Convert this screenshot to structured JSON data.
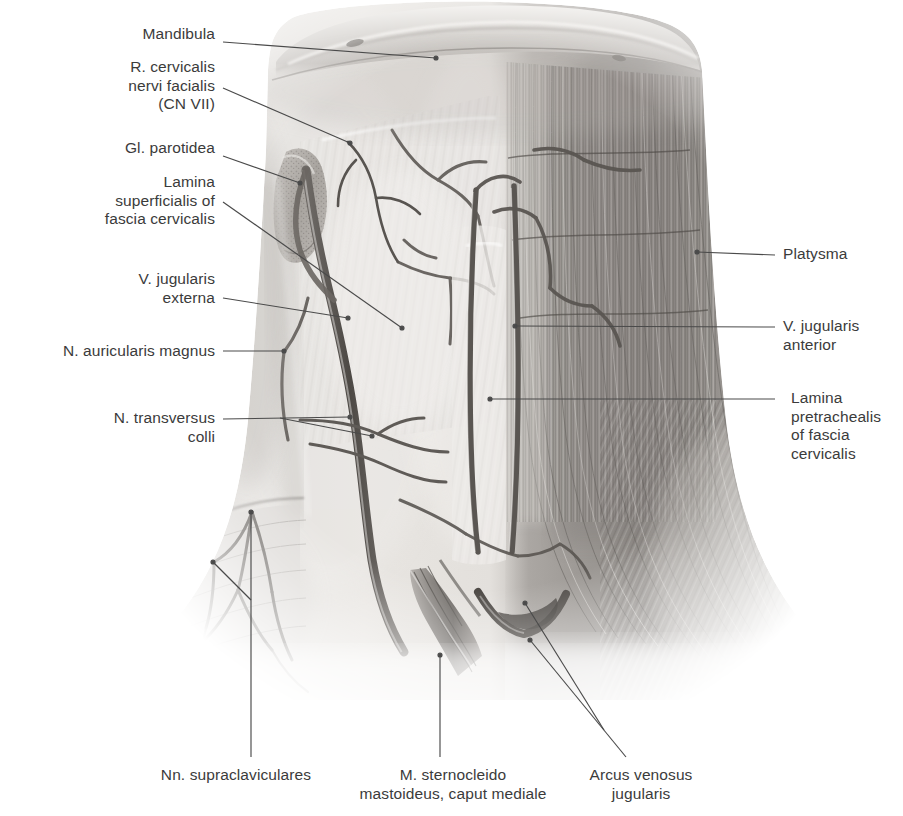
{
  "figure": {
    "type": "anatomical-illustration",
    "style": "grayscale pencil/airbrush medical illustration on white background",
    "view": "anterior view of the neck; platysma reflected on the left side of image, intact on the right side",
    "background_color": "#ffffff",
    "ink_color": "#3b3b3b",
    "leader_line_color": "#4a4a4a"
  },
  "labels": {
    "left": [
      {
        "id": "mandibula",
        "text": "Mandibula",
        "lines": [
          "Mandibula"
        ],
        "align": "right",
        "x": 215,
        "y": 32,
        "leader": {
          "from": [
            223,
            42
          ],
          "to": [
            436,
            58
          ],
          "dot": true
        }
      },
      {
        "id": "r-cervicalis-nervi-facialis",
        "text": "R. cervicalis nervi facialis (CN VII)",
        "lines": [
          "R. cervicalis",
          "nervi facialis",
          "(CN VII)"
        ],
        "align": "right",
        "x": 215,
        "y": 66,
        "leader": {
          "from": [
            223,
            88
          ],
          "to": [
            350,
            143
          ],
          "dot": true
        }
      },
      {
        "id": "gl-parotidea",
        "text": "Gl. parotidea",
        "lines": [
          "Gl. parotidea"
        ],
        "align": "right",
        "x": 215,
        "y": 146,
        "leader": {
          "from": [
            223,
            156
          ],
          "to": [
            300,
            183
          ],
          "dot": true
        }
      },
      {
        "id": "lamina-superficialis-fascia-cervicalis",
        "text": "Lamina superficialis of fascia cervicalis",
        "lines": [
          "Lamina",
          "superficialis of",
          "fascia cervicalis"
        ],
        "align": "right",
        "x": 215,
        "y": 180,
        "leader": {
          "from": [
            223,
            202
          ],
          "to": [
            402,
            328
          ],
          "dot": true
        }
      },
      {
        "id": "v-jugularis-externa",
        "text": "V. jugularis externa",
        "lines": [
          "V. jugularis",
          "externa"
        ],
        "align": "right",
        "x": 215,
        "y": 276,
        "leader": {
          "from": [
            223,
            298
          ],
          "to": [
            348,
            318
          ],
          "dot": true
        }
      },
      {
        "id": "n-auricularis-magnus",
        "text": "N. auricularis magnus",
        "lines": [
          "N. auricularis magnus"
        ],
        "align": "right",
        "x": 215,
        "y": 342,
        "leader": {
          "from": [
            223,
            351
          ],
          "to": [
            284,
            351
          ],
          "dot": true
        }
      },
      {
        "id": "n-transversus-colli",
        "text": "N. transversus colli",
        "lines": [
          "N. transversus",
          "colli"
        ],
        "align": "right",
        "x": 215,
        "y": 410,
        "leader": {
          "from": [
            223,
            419
          ],
          "to": [
            372,
            432
          ],
          "dot": true
        },
        "leader2": {
          "from": [
            223,
            419
          ],
          "to": [
            350,
            417
          ],
          "dot": true
        }
      }
    ],
    "right": [
      {
        "id": "platysma",
        "text": "Platysma",
        "lines": [
          "Platysma"
        ],
        "align": "left",
        "x": 783,
        "y": 245,
        "leader": {
          "from": [
            775,
            255
          ],
          "to": [
            697,
            252
          ],
          "dot": true
        }
      },
      {
        "id": "v-jugularis-anterior",
        "text": "V. jugularis anterior",
        "lines": [
          "V. jugularis",
          "anterior"
        ],
        "align": "left",
        "x": 783,
        "y": 318,
        "leader": {
          "from": [
            775,
            327
          ],
          "to": [
            515,
            326
          ],
          "dot": true
        }
      },
      {
        "id": "lamina-pretrachealis-fascia-cervicalis",
        "text": "Lamina pretrachealis of fascia cervicalis",
        "lines": [
          "Lamina",
          "pretrachealis",
          "of fascia",
          "cervicalis"
        ],
        "align": "left",
        "x": 791,
        "y": 390,
        "leader": {
          "from": [
            775,
            399
          ],
          "to": [
            490,
            399
          ],
          "dot": true
        }
      }
    ],
    "bottom": [
      {
        "id": "nn-supraclaviculares",
        "text": "Nn. supraclaviculares",
        "lines": [
          "Nn. supraclaviculares"
        ],
        "align": "center",
        "x": 236,
        "y": 767,
        "leader": {
          "from": [
            251,
            757
          ],
          "to": [
            251,
            512
          ],
          "dot": true
        },
        "leader2": {
          "from": [
            251,
            600
          ],
          "to": [
            213,
            562
          ],
          "dot": true
        }
      },
      {
        "id": "m-sternocleidomastoideus-caput-mediale",
        "text": "M. sternocleido mastoideus, caput mediale",
        "lines": [
          "M. sternocleido",
          "mastoideus, caput mediale"
        ],
        "align": "center",
        "x": 452,
        "y": 767,
        "leader": {
          "from": [
            440,
            757
          ],
          "to": [
            440,
            655
          ],
          "dot": true
        }
      },
      {
        "id": "arcus-venosus-jugularis",
        "text": "Arcus venosus jugularis",
        "lines": [
          "Arcus venosus",
          "jugularis"
        ],
        "align": "center",
        "x": 639,
        "y": 767,
        "leader": {
          "from": [
            626,
            757
          ],
          "to": [
            530,
            640
          ],
          "dot": true
        },
        "leader2": {
          "from": [
            626,
            757
          ],
          "to": [
            525,
            603
          ],
          "dot": true
        }
      }
    ]
  },
  "structures": [
    {
      "name": "mandibula",
      "description": "inferior border of mandible, smooth pale band across top"
    },
    {
      "name": "parotid gland",
      "description": "granular oval mass beneath the mandible angle, left of image"
    },
    {
      "name": "platysma",
      "description": "broad striated sheet covering the right half of the neck, fibers running superoinferiorly and fanning laterally at the bottom"
    },
    {
      "name": "external jugular vein",
      "description": "thick dark vessel descending obliquely on the left side of the neck"
    },
    {
      "name": "anterior jugular veins",
      "description": "paired vertical vessels near midline"
    },
    {
      "name": "jugular venous arch",
      "description": "transverse venous connection in the suprasternal notch"
    },
    {
      "name": "sternocleidomastoid, medial head",
      "description": "tendinous strap at bottom centre-left"
    },
    {
      "name": "supraclavicular nerves",
      "description": "fine branching nerves spreading over the lower left shoulder region"
    },
    {
      "name": "transverse cervical nerve",
      "description": "nerve crossing horizontally over the neck on the left"
    },
    {
      "name": "great auricular nerve",
      "description": "nerve ascending over the sternocleidomastoid on the left"
    },
    {
      "name": "cervical branch of facial nerve",
      "description": "fine branch descending from the parotid region"
    },
    {
      "name": "superficial layer of cervical fascia",
      "description": "translucent sheet over the left anterior triangle"
    },
    {
      "name": "pretracheal layer of cervical fascia",
      "description": "midline fascial sheet deep to the veins"
    }
  ]
}
